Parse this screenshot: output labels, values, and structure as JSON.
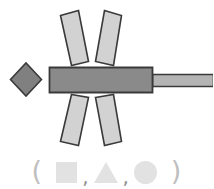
{
  "figure": {
    "background_color": "#ffffff",
    "stroke_color": "#3a3a3a",
    "body_fill": "#8a8a8a",
    "diamond_fill": "#808080",
    "tail_fill": "#b4b4b4",
    "petal_fill": "#d2d2d2",
    "legend_fill": "#e2e2e2",
    "parts": [
      {
        "name": "diamond-head",
        "shape": "diamond",
        "fill": "#808080"
      },
      {
        "name": "main-body-bar",
        "shape": "rectangle",
        "fill": "#8a8a8a"
      },
      {
        "name": "tail-bar",
        "shape": "rectangle",
        "fill": "#b4b4b4"
      },
      {
        "name": "petal-top-left",
        "shape": "rotated-rectangle",
        "fill": "#d2d2d2"
      },
      {
        "name": "petal-top-right",
        "shape": "rotated-rectangle",
        "fill": "#d2d2d2"
      },
      {
        "name": "petal-bottom-left",
        "shape": "rotated-rectangle",
        "fill": "#d2d2d2"
      },
      {
        "name": "petal-bottom-right",
        "shape": "rotated-rectangle",
        "fill": "#d2d2d2"
      }
    ]
  },
  "legend": {
    "open_paren": "(",
    "close_paren": ")",
    "separator": ",",
    "items": [
      {
        "icon": "square-icon",
        "shape": "square"
      },
      {
        "icon": "triangle-icon",
        "shape": "triangle"
      },
      {
        "icon": "circle-icon",
        "shape": "circle"
      }
    ]
  }
}
